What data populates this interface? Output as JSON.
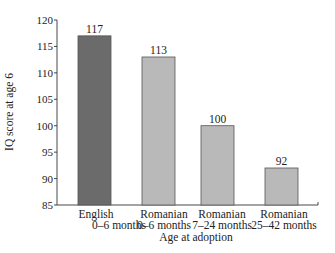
{
  "chart_data": {
    "type": "bar",
    "title": "",
    "xlabel": "Age at adoption",
    "ylabel": "IQ score at age 6",
    "ylim": [
      85,
      120
    ],
    "yticks": [
      85,
      90,
      95,
      100,
      105,
      110,
      115,
      120
    ],
    "grid": false,
    "legend": null,
    "categories": [
      {
        "line1": "English",
        "line2": "0–6 months"
      },
      {
        "line1": "Romanian",
        "line2": "0–6 months"
      },
      {
        "line1": "Romanian",
        "line2": "7–24 months"
      },
      {
        "line1": "Romanian",
        "line2": "25–42 months"
      }
    ],
    "category_labels": [
      "English 0–6 months",
      "Romanian 0–6 months",
      "Romanian 7–24 months",
      "Romanian 25–42 months"
    ],
    "values": [
      117,
      113,
      100,
      92
    ],
    "value_labels": [
      "117",
      "113",
      "100",
      "92"
    ],
    "colors": [
      "#6b6b6b",
      "#b9b9b9",
      "#b9b9b9",
      "#b9b9b9"
    ]
  }
}
